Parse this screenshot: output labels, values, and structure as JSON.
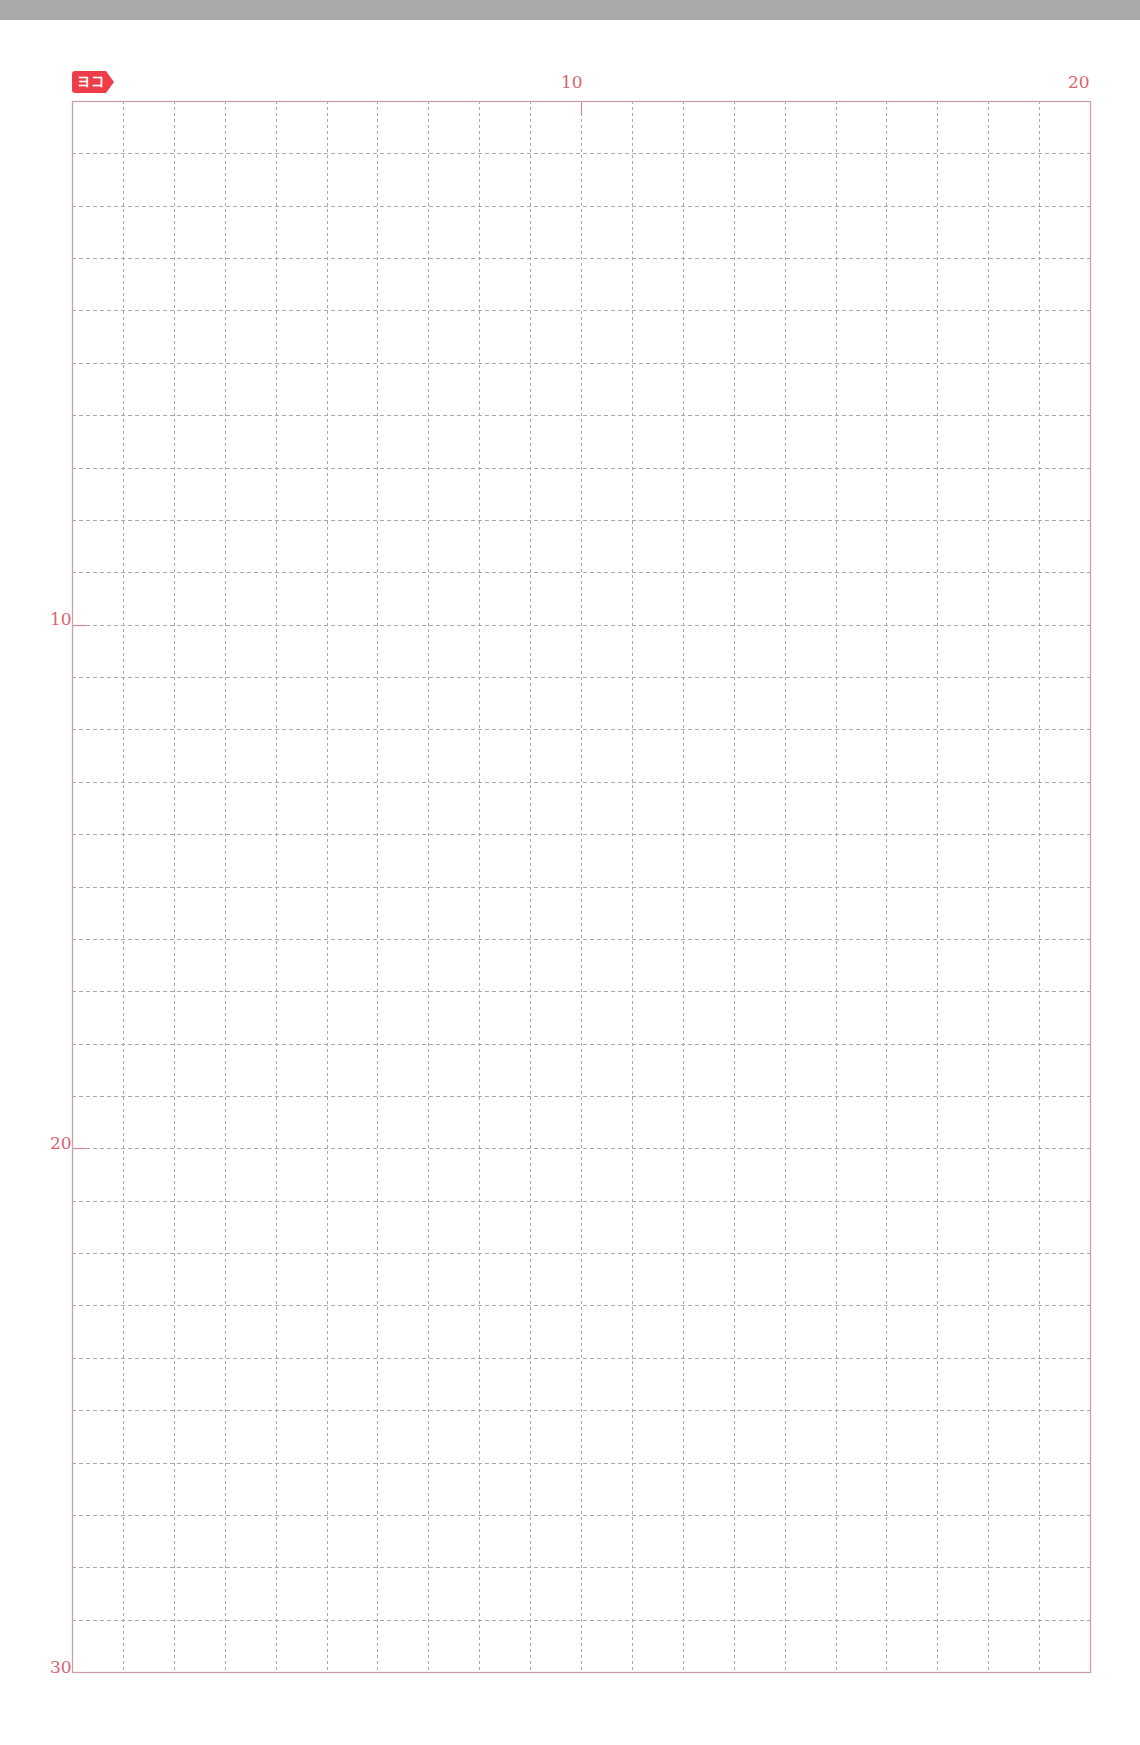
{
  "page": {
    "tag_label": "ヨコ",
    "orientation": "horizontal writing grid",
    "columns": 20,
    "rows": 30,
    "column_labels": [
      {
        "index": 10,
        "text": "10"
      },
      {
        "index": 20,
        "text": "20"
      }
    ],
    "row_labels": [
      {
        "index": 10,
        "text": "10"
      },
      {
        "index": 20,
        "text": "20"
      },
      {
        "index": 30,
        "text": "30"
      }
    ]
  },
  "colors": {
    "tag": "#ee3c48",
    "label": "#d9646f",
    "border": "#c9a0a8",
    "major_line": "#c98a96",
    "dash": "#a8a8b0",
    "top_bar": "#a9a9a9"
  },
  "geometry": {
    "left": 72,
    "top": 101,
    "right": 1090,
    "bottom": 1672
  }
}
